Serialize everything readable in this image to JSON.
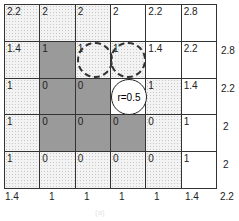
{
  "grid": {
    "rows": [
      [
        {
          "v": "2.2",
          "s": "light"
        },
        {
          "v": "2",
          "s": "light"
        },
        {
          "v": "2",
          "s": "light"
        },
        {
          "v": "2",
          "s": "white"
        },
        {
          "v": "2.2",
          "s": "white"
        },
        {
          "v": "2.8",
          "s": "white"
        }
      ],
      [
        {
          "v": "1.4",
          "s": "light"
        },
        {
          "v": "1",
          "s": "dark"
        },
        {
          "v": "1",
          "s": "light"
        },
        {
          "v": "1",
          "s": "light"
        },
        {
          "v": "1.4",
          "s": "white"
        },
        {
          "v": "2.2",
          "s": "white"
        }
      ],
      [
        {
          "v": "1",
          "s": "light"
        },
        {
          "v": "0",
          "s": "dark"
        },
        {
          "v": "0",
          "s": "dark"
        },
        {
          "v": "",
          "s": "white"
        },
        {
          "v": "1",
          "s": "light"
        },
        {
          "v": "1.4",
          "s": "white"
        }
      ],
      [
        {
          "v": "1",
          "s": "light"
        },
        {
          "v": "0",
          "s": "dark"
        },
        {
          "v": "0",
          "s": "dark"
        },
        {
          "v": "0",
          "s": "dark"
        },
        {
          "v": "0",
          "s": "light"
        },
        {
          "v": "1",
          "s": "white"
        }
      ],
      [
        {
          "v": "1",
          "s": "light"
        },
        {
          "v": "0",
          "s": "light"
        },
        {
          "v": "0",
          "s": "light"
        },
        {
          "v": "0",
          "s": "light"
        },
        {
          "v": "0",
          "s": "light"
        },
        {
          "v": "1",
          "s": "white"
        }
      ]
    ]
  },
  "right_labels": [
    "2.8",
    "2.2",
    "2",
    "2"
  ],
  "bottom_labels": [
    "1.4",
    "1",
    "1",
    "1",
    "1",
    "1.4",
    "2.2"
  ],
  "circle_label": "r=0.5",
  "caption": "(a)"
}
